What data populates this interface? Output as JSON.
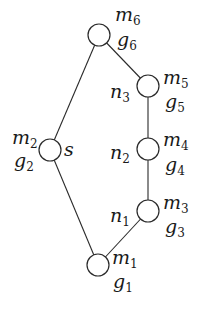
{
  "diagram": {
    "type": "graph",
    "colors": {
      "stroke": "#2a2a2a",
      "text": "#1a1a1a",
      "background": "#ffffff"
    },
    "nodes": [
      {
        "id": "v6",
        "x": 99,
        "y": 35,
        "r": 11,
        "labels": {
          "m": "m",
          "m_sub": "6",
          "g": "g",
          "g_sub": "6"
        }
      },
      {
        "id": "v5",
        "x": 148,
        "y": 86,
        "r": 11,
        "labels": {
          "m": "m",
          "m_sub": "5",
          "g": "g",
          "g_sub": "5",
          "n": "n",
          "n_sub": "3"
        }
      },
      {
        "id": "v4",
        "x": 148,
        "y": 149,
        "r": 11,
        "labels": {
          "m": "m",
          "m_sub": "4",
          "g": "g",
          "g_sub": "4",
          "n": "n",
          "n_sub": "2"
        }
      },
      {
        "id": "v3",
        "x": 148,
        "y": 211,
        "r": 11,
        "labels": {
          "m": "m",
          "m_sub": "3",
          "g": "g",
          "g_sub": "3",
          "n": "n",
          "n_sub": "1"
        }
      },
      {
        "id": "v1",
        "x": 98,
        "y": 265,
        "r": 11,
        "labels": {
          "m": "m",
          "m_sub": "1",
          "g": "g",
          "g_sub": "1"
        }
      },
      {
        "id": "v2",
        "x": 50,
        "y": 150,
        "r": 11,
        "labels": {
          "m": "m",
          "m_sub": "2",
          "g": "g",
          "g_sub": "2",
          "s": "s"
        }
      }
    ],
    "edges": [
      [
        "v6",
        "v2"
      ],
      [
        "v6",
        "v5"
      ],
      [
        "v5",
        "v4"
      ],
      [
        "v4",
        "v3"
      ],
      [
        "v3",
        "v1"
      ],
      [
        "v2",
        "v1"
      ]
    ]
  }
}
